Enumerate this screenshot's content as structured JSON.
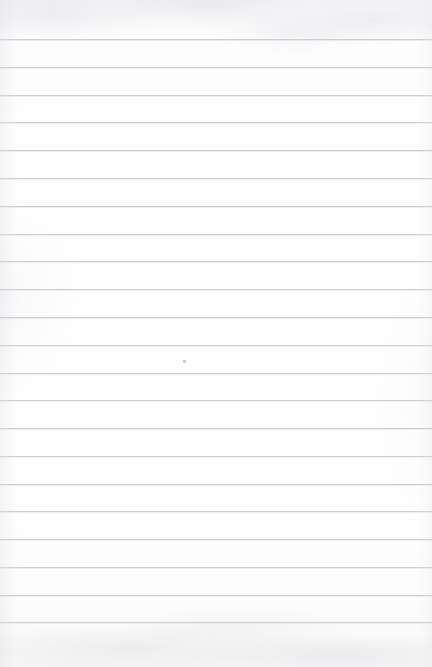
{
  "document": {
    "kind": "blank-ruled-notebook-paper",
    "title": "Blank lined paper",
    "page_width": 432,
    "page_height": 667,
    "paper_color": "#fdfdfe",
    "rule_color": "#c9cbd0",
    "written_content": "",
    "line_count": 21,
    "first_line_y": 39,
    "line_spacing": 27.8,
    "top_margin_label": "",
    "bottom_margin_label": "",
    "rule_lines": [
      {
        "index": 1,
        "y": 39,
        "opacity": 0.95
      },
      {
        "index": 2,
        "y": 67,
        "opacity": 0.92
      },
      {
        "index": 3,
        "y": 95,
        "opacity": 0.95
      },
      {
        "index": 4,
        "y": 122,
        "opacity": 0.88
      },
      {
        "index": 5,
        "y": 150,
        "opacity": 0.95
      },
      {
        "index": 6,
        "y": 178,
        "opacity": 0.9
      },
      {
        "index": 7,
        "y": 206,
        "opacity": 0.93
      },
      {
        "index": 8,
        "y": 234,
        "opacity": 0.88
      },
      {
        "index": 9,
        "y": 261,
        "opacity": 0.93
      },
      {
        "index": 10,
        "y": 289,
        "opacity": 0.9
      },
      {
        "index": 11,
        "y": 317,
        "opacity": 0.94
      },
      {
        "index": 12,
        "y": 345,
        "opacity": 0.88
      },
      {
        "index": 13,
        "y": 373,
        "opacity": 0.93
      },
      {
        "index": 14,
        "y": 400,
        "opacity": 0.9
      },
      {
        "index": 15,
        "y": 428,
        "opacity": 0.94
      },
      {
        "index": 16,
        "y": 456,
        "opacity": 0.88
      },
      {
        "index": 17,
        "y": 484,
        "opacity": 0.93
      },
      {
        "index": 18,
        "y": 511,
        "opacity": 0.9
      },
      {
        "index": 19,
        "y": 539,
        "opacity": 0.94
      },
      {
        "index": 20,
        "y": 567,
        "opacity": 0.9
      },
      {
        "index": 21,
        "y": 595,
        "opacity": 0.93
      },
      {
        "index": 22,
        "y": 622,
        "opacity": 0.88
      }
    ],
    "marks": [
      {
        "name": "paper-speck",
        "x": 183,
        "y": 360
      }
    ]
  }
}
